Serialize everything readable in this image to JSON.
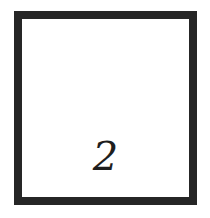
{
  "card": {
    "number": "2",
    "border_color": "#262626",
    "background_color": "#ffffff",
    "text_color": "#1e1e1e"
  }
}
